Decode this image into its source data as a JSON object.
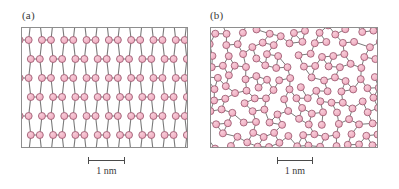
{
  "figure": {
    "width": 399,
    "height": 189,
    "background": "#ffffff",
    "atom_fill": "#efa8bd",
    "atom_fill_light": "#f7cdd9",
    "atom_stroke": "#9c5a70",
    "bond_color": "#7a7a7a",
    "frame_color": "#8e8e8e",
    "label_color": "#3a3a3a"
  },
  "panels": [
    {
      "id": "crystalline",
      "label": "(a)",
      "label_x": 22,
      "label_y": 9,
      "frame": {
        "x": 21,
        "y": 27,
        "width": 167,
        "height": 121
      },
      "structure_type": "crystalline-lattice",
      "scalebar": {
        "x": 88,
        "y": 157,
        "width": 37,
        "label": "1 nm",
        "value": 1,
        "unit": "nm"
      }
    },
    {
      "id": "amorphous",
      "label": "(b)",
      "label_x": 210,
      "label_y": 9,
      "frame": {
        "x": 210,
        "y": 27,
        "width": 168,
        "height": 121
      },
      "structure_type": "amorphous-network",
      "scalebar": {
        "x": 277,
        "y": 157,
        "width": 36,
        "label": "1 nm",
        "value": 1,
        "unit": "nm"
      }
    }
  ],
  "chart_data": {
    "type": "scatter",
    "title": "",
    "panel_a": {
      "label": "(a)",
      "lattice": "honeycomb with horizontal dimer bonds",
      "cell_width": 22.3,
      "cell_height": 19.0,
      "scalebar_nm": 1,
      "scalebar_px": 37
    },
    "panel_b": {
      "label": "(b)",
      "lattice": "amorphous random network, 5/6/7-membered rings",
      "scalebar_nm": 1,
      "scalebar_px": 36
    }
  }
}
